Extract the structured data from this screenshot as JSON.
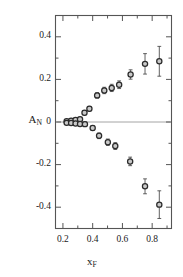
{
  "chart_data": {
    "type": "scatter",
    "title": "",
    "xlabel": "x_F",
    "ylabel": "A_N",
    "xlim": [
      0.15,
      0.93
    ],
    "ylim": [
      -0.5,
      0.5
    ],
    "xticks": [
      0.2,
      0.4,
      0.6,
      0.8
    ],
    "xtick_labels": [
      "0.2",
      "0.4",
      "0.6",
      "0.8"
    ],
    "yticks": [
      -0.4,
      -0.2,
      0,
      0.2,
      0.4
    ],
    "ytick_labels": [
      "-0.4",
      "-0.2",
      "0",
      "0.2",
      "0.4"
    ],
    "minor_xticks": [
      0.3,
      0.5,
      0.7,
      0.9
    ],
    "minor_yticks": [
      -0.3,
      -0.1,
      0.1,
      0.3
    ],
    "grid": false,
    "legend": null,
    "zero_line": true,
    "marker": "open-circle",
    "series": [
      {
        "name": "positive-branch",
        "points": [
          {
            "x": 0.225,
            "y": 0.004,
            "yerr": 0.006
          },
          {
            "x": 0.255,
            "y": 0.006,
            "yerr": 0.007
          },
          {
            "x": 0.285,
            "y": 0.01,
            "yerr": 0.008
          },
          {
            "x": 0.315,
            "y": 0.013,
            "yerr": 0.009
          },
          {
            "x": 0.345,
            "y": 0.043,
            "yerr": 0.01
          },
          {
            "x": 0.378,
            "y": 0.062,
            "yerr": 0.011
          },
          {
            "x": 0.43,
            "y": 0.125,
            "yerr": 0.013
          },
          {
            "x": 0.478,
            "y": 0.148,
            "yerr": 0.015
          },
          {
            "x": 0.528,
            "y": 0.16,
            "yerr": 0.017
          },
          {
            "x": 0.578,
            "y": 0.175,
            "yerr": 0.018
          },
          {
            "x": 0.655,
            "y": 0.223,
            "yerr": 0.022
          },
          {
            "x": 0.752,
            "y": 0.273,
            "yerr": 0.048
          },
          {
            "x": 0.848,
            "y": 0.285,
            "yerr": 0.07
          }
        ]
      },
      {
        "name": "negative-branch",
        "points": [
          {
            "x": 0.225,
            "y": -0.004,
            "yerr": 0.006
          },
          {
            "x": 0.255,
            "y": -0.005,
            "yerr": 0.007
          },
          {
            "x": 0.285,
            "y": -0.007,
            "yerr": 0.008
          },
          {
            "x": 0.315,
            "y": -0.009,
            "yerr": 0.009
          },
          {
            "x": 0.348,
            "y": -0.01,
            "yerr": 0.01
          },
          {
            "x": 0.4,
            "y": -0.028,
            "yerr": 0.011
          },
          {
            "x": 0.443,
            "y": -0.065,
            "yerr": 0.013
          },
          {
            "x": 0.502,
            "y": -0.095,
            "yerr": 0.015
          },
          {
            "x": 0.552,
            "y": -0.113,
            "yerr": 0.016
          },
          {
            "x": 0.652,
            "y": -0.185,
            "yerr": 0.02
          },
          {
            "x": 0.752,
            "y": -0.302,
            "yerr": 0.035
          },
          {
            "x": 0.848,
            "y": -0.388,
            "yerr": 0.065
          }
        ]
      }
    ],
    "colors": {
      "axis": "#555555",
      "marker_edge": "#2b2b2b",
      "marker_face": "#c9c9c9",
      "errorbar": "#444444",
      "zero_line": "#9a9a9a",
      "background": "#ffffff"
    }
  },
  "axes": {
    "y_label_text": "A",
    "y_label_sub": "N",
    "x_label_text": "x",
    "x_label_sub": "F"
  }
}
